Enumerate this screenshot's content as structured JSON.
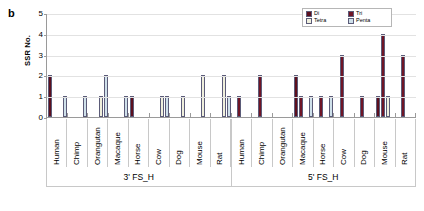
{
  "panel": {
    "letter": "b"
  },
  "axes": {
    "ylabel": "SSR No.",
    "yticks": [
      "0",
      "1",
      "2",
      "3",
      "4",
      "5"
    ]
  },
  "legend": {
    "items": [
      {
        "label": "Di",
        "color": "#5c0f1e"
      },
      {
        "label": "Tri",
        "color": "#6f1526"
      },
      {
        "label": "Tetra",
        "color": "#efefdc"
      },
      {
        "label": "Penta",
        "color": "#cfe0ea"
      }
    ]
  },
  "groups": [
    {
      "label": "3' FS_H"
    },
    {
      "label": "5' FS_H"
    }
  ],
  "chart_data": {
    "type": "bar",
    "title": "",
    "xlabel": "",
    "ylabel": "SSR No.",
    "ylim": [
      0,
      5
    ],
    "yticks": [
      0,
      1,
      2,
      3,
      4,
      5
    ],
    "grid": true,
    "legend_position": "top-right",
    "panel_letter": "b",
    "group_labels": [
      "3' FS_H",
      "5' FS_H"
    ],
    "categories": [
      "Human",
      "Chimp",
      "Orangutan",
      "Macaque",
      "Horse",
      "Cow",
      "Dog",
      "Mouse",
      "Rat",
      "Human",
      "Chimp",
      "Orangutan",
      "Macaque",
      "Horse",
      "Cow",
      "Dog",
      "Mouse",
      "Rat"
    ],
    "series": [
      {
        "name": "Di",
        "color": "#5c0f1e",
        "values": [
          2,
          0,
          0,
          0,
          1,
          0,
          0,
          0,
          0,
          0,
          0,
          0,
          2,
          0,
          0,
          0,
          1,
          0
        ]
      },
      {
        "name": "Tri",
        "color": "#6f1526",
        "values": [
          0,
          0,
          0,
          0,
          0,
          0,
          0,
          0,
          0,
          1,
          2,
          0,
          1,
          1,
          3,
          1,
          4,
          3
        ]
      },
      {
        "name": "Tetra",
        "color": "#efefdc",
        "values": [
          0,
          0,
          1,
          0,
          0,
          1,
          1,
          2,
          2,
          0,
          0,
          0,
          0,
          0,
          0,
          0,
          1,
          0
        ]
      },
      {
        "name": "Penta",
        "color": "#cfe0ea",
        "values": [
          1,
          1,
          2,
          1,
          0,
          1,
          0,
          0,
          1,
          0,
          0,
          0,
          1,
          1,
          0,
          0,
          0,
          0
        ]
      }
    ]
  }
}
